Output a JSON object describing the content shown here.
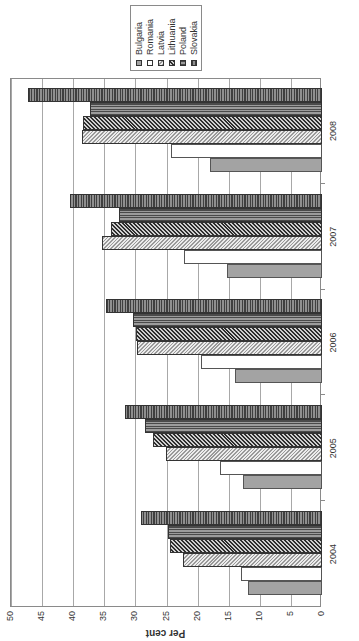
{
  "chart_data": {
    "type": "bar",
    "orientation_note": "figure rotated 90 degrees counterclockwise in screenshot",
    "title": "",
    "xlabel": "",
    "ylabel": "Per cent",
    "ylim": [
      0,
      50
    ],
    "yticks": [
      0,
      5,
      10,
      15,
      20,
      25,
      30,
      35,
      40,
      45,
      50
    ],
    "grid": true,
    "legend_position": "right",
    "categories": [
      "2004",
      "2005",
      "2006",
      "2007",
      "2008"
    ],
    "series": [
      {
        "name": "Bulgaria",
        "pattern": "solid-gray",
        "values": [
          11.9,
          12.7,
          14.0,
          15.3,
          18.0
        ]
      },
      {
        "name": "Romania",
        "pattern": "white",
        "values": [
          13.0,
          16.4,
          19.5,
          22.2,
          24.3
        ]
      },
      {
        "name": "Latvia",
        "pattern": "light-diagonal",
        "values": [
          22.3,
          25.1,
          29.7,
          35.4,
          38.6
        ]
      },
      {
        "name": "Lithuania",
        "pattern": "dark-diagonal",
        "values": [
          24.4,
          27.2,
          29.9,
          33.9,
          38.4
        ]
      },
      {
        "name": "Poland",
        "pattern": "horizontal-stripes",
        "values": [
          24.8,
          28.5,
          30.4,
          32.6,
          37.3
        ]
      },
      {
        "name": "Slovakia",
        "pattern": "vertical-stripes",
        "values": [
          29.1,
          31.7,
          34.7,
          40.5,
          47.3
        ]
      }
    ]
  },
  "legend": {
    "items": [
      {
        "label": "Bulgaria",
        "cls": "p-bulgaria"
      },
      {
        "label": "Romania",
        "cls": "p-romania"
      },
      {
        "label": "Latvia",
        "cls": "p-latvia"
      },
      {
        "label": "Lithuania",
        "cls": "p-lithuania"
      },
      {
        "label": "Poland",
        "cls": "p-poland"
      },
      {
        "label": "Slovakia",
        "cls": "p-slovakia"
      }
    ]
  },
  "colors": {
    "bulgaria": "#a3a3a3",
    "romania": "#ffffff",
    "grid": "#a8a8a8",
    "axis": "#8a8a8a"
  }
}
